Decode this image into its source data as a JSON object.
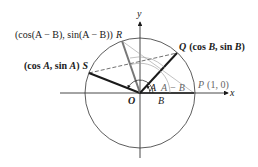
{
  "diagram": {
    "axes": {
      "x_label": "x",
      "y_label": "y"
    },
    "origin_label": "O",
    "points": {
      "P": {
        "name": "P",
        "coords": "(1, 0)"
      },
      "Q": {
        "name": "Q",
        "coords_prefix": "(cos ",
        "coords_mid": ", sin ",
        "coords_suffix": ")",
        "arg": "B"
      },
      "R": {
        "name": "R",
        "text": "(cos(A − B), sin(A − B))"
      },
      "S": {
        "name": "S",
        "text_prefix": "(cos ",
        "text_mid": ", sin ",
        "text_suffix": ")",
        "arg": "A"
      }
    },
    "angle_labels": {
      "A": "A",
      "B": "B",
      "A_minus_B": "A − B"
    },
    "colors": {
      "ink": "#1a1a1a",
      "gray_line": "#777777",
      "light_line": "#999999",
      "circle": "#333333"
    }
  }
}
